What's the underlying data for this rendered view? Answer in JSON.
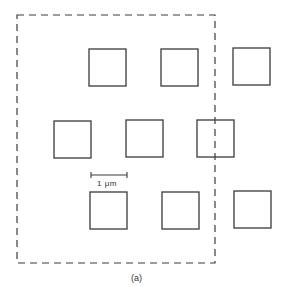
{
  "figure": {
    "caption": "(a)",
    "scale_bar": {
      "label": "1 μm",
      "x1": 91,
      "x2": 127,
      "y": 175
    },
    "frame": {
      "style": "dashed",
      "x": 17,
      "y": 15,
      "width": 198,
      "height": 248
    },
    "squares": [
      {
        "row": 1,
        "x": 89,
        "y": 49,
        "size": 37
      },
      {
        "row": 1,
        "x": 161,
        "y": 49,
        "size": 37
      },
      {
        "row": 1,
        "x": 233,
        "y": 48,
        "size": 37
      },
      {
        "row": 2,
        "x": 54,
        "y": 121,
        "size": 37
      },
      {
        "row": 2,
        "x": 126,
        "y": 120,
        "size": 37
      },
      {
        "row": 2,
        "x": 197,
        "y": 120,
        "size": 37
      },
      {
        "row": 3,
        "x": 90,
        "y": 192,
        "size": 37
      },
      {
        "row": 3,
        "x": 162,
        "y": 192,
        "size": 37
      },
      {
        "row": 3,
        "x": 234,
        "y": 191,
        "size": 37
      }
    ],
    "colors": {
      "stroke": "#3a3a3a",
      "background": "#ffffff"
    }
  }
}
